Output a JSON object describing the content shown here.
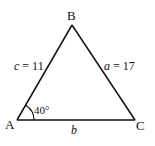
{
  "diagram": {
    "type": "triangle",
    "stroke_color": "#111111",
    "background": "#ffffff",
    "vertices": {
      "A": {
        "label": "A",
        "x": 17,
        "y": 120
      },
      "B": {
        "label": "B",
        "x": 72,
        "y": 25
      },
      "C": {
        "label": "C",
        "x": 135,
        "y": 120
      }
    },
    "sides": {
      "c": {
        "var": "c",
        "eq": " = 11",
        "between": [
          "A",
          "B"
        ]
      },
      "a": {
        "var": "a",
        "eq": " = 17",
        "between": [
          "B",
          "C"
        ]
      },
      "b": {
        "var": "b",
        "between": [
          "A",
          "C"
        ]
      }
    },
    "angle": {
      "vertex": "A",
      "label": "40°"
    }
  }
}
